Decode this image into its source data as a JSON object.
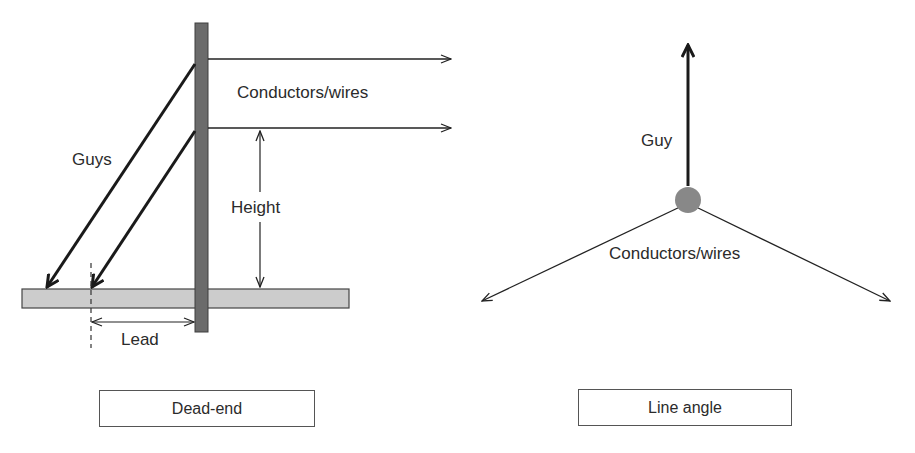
{
  "dead_end": {
    "labels": {
      "conductors": "Conductors/wires",
      "guys": "Guys",
      "height": "Height",
      "lead": "Lead"
    },
    "caption": "Dead-end"
  },
  "line_angle": {
    "labels": {
      "guy": "Guy",
      "conductors": "Conductors/wires"
    },
    "caption": "Line angle"
  },
  "colors": {
    "pole": "#6b6b6b",
    "ground": "#cccccc",
    "line": "#222222",
    "node": "#888888"
  }
}
